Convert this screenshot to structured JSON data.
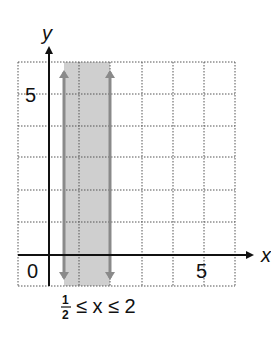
{
  "diagram": {
    "axis_labels": {
      "x": "x",
      "y": "y"
    },
    "tick_labels": {
      "origin": "0",
      "x5": "5",
      "y5": "5"
    },
    "inequality": {
      "frac_num": "1",
      "frac_den": "2",
      "rest": "≤ x ≤ 2",
      "le1": "≤"
    },
    "shaded_region": {
      "x_min": 0.5,
      "x_max": 2,
      "color": "#c8c8c8"
    },
    "boundary_color": "#8a8a8a",
    "grid": {
      "x_range": [
        -1,
        6
      ],
      "y_range": [
        -1,
        6
      ]
    }
  }
}
